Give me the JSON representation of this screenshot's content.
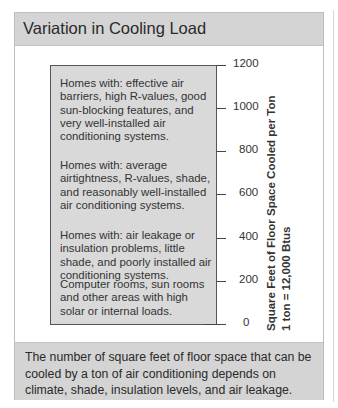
{
  "title": "Variation in Cooling Load",
  "bands": [
    {
      "text": "Homes with: effective air barriers, high R-values, good sun-blocking features, and very well-installed air conditioning systems."
    },
    {
      "text": "Homes with: average airtightness, R-values, shade, and reasonably well-installed air conditioning systems."
    },
    {
      "text": "Homes with: air leakage or insulation problems, little shade, and poorly installed air conditioning systems."
    },
    {
      "text": "Computer rooms, sun rooms and other areas with high solar or internal loads."
    }
  ],
  "axis": {
    "ticks": [
      "1200",
      "1000",
      "800",
      "600",
      "400",
      "200",
      "0"
    ],
    "title_line1": "Square Feet of Floor Space Cooled per Ton",
    "title_line2": "1 ton = 12,000 Btus"
  },
  "caption": "The number of square feet of floor space that can be cooled by a ton of air conditioning depends on climate, shade, insulation levels, and air leakage.",
  "colors": {
    "header_bg": "#d4d4d4",
    "box_bg": "#d9d9d9",
    "border": "#555555"
  }
}
